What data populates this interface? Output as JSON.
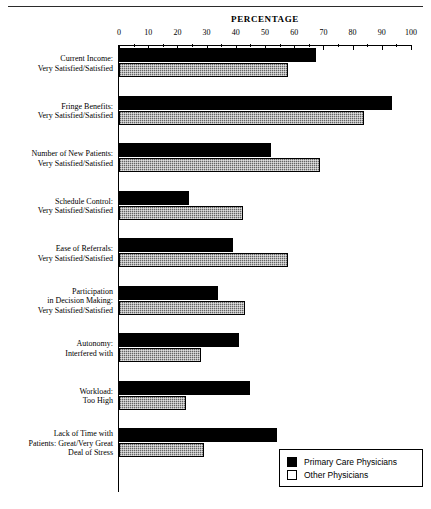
{
  "chart_data": {
    "type": "bar",
    "orientation": "horizontal",
    "title": "",
    "xlabel": "PERCENTAGE",
    "ylabel": "",
    "xlim": [
      0,
      100
    ],
    "grid": false,
    "legend_position": "bottom-right",
    "tick_labels": [
      "0",
      "10",
      "20",
      "30",
      "40",
      "50",
      "60",
      "70",
      "80",
      "90",
      "100"
    ],
    "tick_values": [
      0,
      10,
      20,
      30,
      40,
      50,
      60,
      70,
      80,
      90,
      100
    ],
    "categories": [
      "Current Income:\nVery Satisfied/Satisfied",
      "Fringe Benefits:\nVery Satisfied/Satisfied",
      "Number of New Patients:\nVery Satisfied/Satisfied",
      "Schedule Control:\nVery Satisfied/Satisfied",
      "Ease of Referrals:\nVery Satisfied/Satisfied",
      "Participation\nin Decision Making:\nVery Satisfied/Satisfied",
      "Autonomy:\nInterfered with",
      "Workload:\nToo High",
      "Lack of Time with\nPatients: Great/Very Great\nDeal of Stress"
    ],
    "series": [
      {
        "name": "Primary Care Physicians",
        "color": "#000000",
        "values": [
          67.5,
          93.5,
          52,
          24,
          39,
          34,
          41,
          45,
          54
        ]
      },
      {
        "name": "Other Physicians",
        "color": "#9a9a9a",
        "values": [
          58,
          84,
          69,
          42.5,
          58,
          43,
          28,
          23,
          29
        ]
      }
    ]
  },
  "legend": {
    "entries": [
      {
        "label": "Primary Care Physicians",
        "swatch": "filled-black-square"
      },
      {
        "label": "Other Physicians",
        "swatch": "open-white-square"
      }
    ]
  }
}
